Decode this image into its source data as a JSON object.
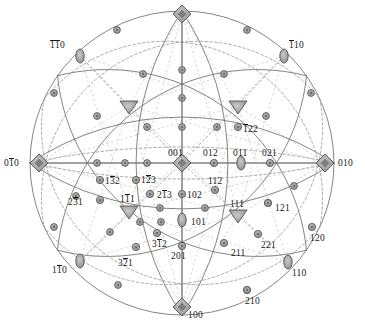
{
  "figure": {
    "type": "stereographic-projection",
    "title": "",
    "circle": {
      "cx": 182,
      "cy": 163,
      "r": 152
    },
    "colors": {
      "background": "#ffffff",
      "line": "#6b6b6b",
      "dashed_line": "#8a8a8a",
      "pole_fill": "#9a9a9a",
      "pole_stroke": "#4a4a4a",
      "text": "#171717"
    },
    "symbols": {
      "four-fold": "filled diamond (square rotated 45°)",
      "three-fold": "filled triangle",
      "two-fold": "small lens / ellipse",
      "general": "small circle"
    }
  },
  "poles": [
    {
      "id": "001",
      "label": "001",
      "bars": [],
      "x": 182,
      "y": 163,
      "sym": "four-fold",
      "lx": 168,
      "ly": 148,
      "anchor": "left"
    },
    {
      "id": "100",
      "label": "100",
      "bars": [],
      "x": 182,
      "y": 307,
      "sym": "four-fold",
      "lx": 188,
      "ly": 310,
      "anchor": "left"
    },
    {
      "id": "010",
      "label": "010",
      "bars": [],
      "x": 325,
      "y": 163,
      "sym": "four-fold",
      "lx": 338,
      "ly": 158,
      "anchor": "left"
    },
    {
      "id": "0-10",
      "label": "010",
      "bars": [
        1
      ],
      "x": 39,
      "y": 163,
      "sym": "four-fold",
      "lx": 4,
      "ly": 158,
      "anchor": "left"
    },
    {
      "id": "001t",
      "label": "001",
      "bars": [],
      "x": 182,
      "y": 14,
      "sym": "four-fold",
      "lx": 0,
      "ly": 0,
      "anchor": "none"
    },
    {
      "id": "-1-10",
      "label": "110",
      "bars": [
        0,
        1
      ],
      "x": 80,
      "y": 56,
      "sym": "two-fold",
      "lx": 50,
      "ly": 40,
      "anchor": "left"
    },
    {
      "id": "-110",
      "label": "110",
      "bars": [
        0
      ],
      "x": 284,
      "y": 56,
      "sym": "two-fold",
      "lx": 289,
      "ly": 40,
      "anchor": "left"
    },
    {
      "id": "1-10",
      "label": "110",
      "bars": [
        1
      ],
      "x": 80,
      "y": 261,
      "sym": "two-fold",
      "lx": 52,
      "ly": 265,
      "anchor": "left"
    },
    {
      "id": "110",
      "label": "110",
      "bars": [],
      "x": 288,
      "y": 262,
      "sym": "two-fold",
      "lx": 292,
      "ly": 268,
      "anchor": "left"
    },
    {
      "id": "011",
      "label": "011",
      "bars": [],
      "x": 241,
      "y": 163,
      "sym": "two-fold",
      "lx": 233,
      "ly": 148,
      "anchor": "left"
    },
    {
      "id": "101",
      "label": "101",
      "bars": [],
      "x": 182,
      "y": 220,
      "sym": "two-fold",
      "lx": 191,
      "ly": 217,
      "anchor": "left"
    },
    {
      "id": "012",
      "label": "012",
      "bars": [],
      "x": 214,
      "y": 163,
      "sym": "general",
      "lx": 203,
      "ly": 148,
      "anchor": "left"
    },
    {
      "id": "021",
      "label": "021",
      "bars": [],
      "x": 270,
      "y": 163,
      "sym": "general",
      "lx": 262,
      "ly": 148,
      "anchor": "left"
    },
    {
      "id": "102",
      "label": "102",
      "bars": [],
      "x": 182,
      "y": 194,
      "sym": "general",
      "lx": 187,
      "ly": 190,
      "anchor": "left"
    },
    {
      "id": "201",
      "label": "201",
      "bars": [],
      "x": 182,
      "y": 246,
      "sym": "general",
      "lx": 171,
      "ly": 251,
      "anchor": "left"
    },
    {
      "id": "111",
      "label": "111",
      "bars": [],
      "x": 238,
      "y": 215,
      "sym": "three-fold",
      "lx": 230,
      "ly": 199,
      "anchor": "left"
    },
    {
      "id": "1-11",
      "label": "111",
      "bars": [
        1
      ],
      "x": 129,
      "y": 211,
      "sym": "three-fold",
      "lx": 120,
      "ly": 194,
      "anchor": "left"
    },
    {
      "id": "-111",
      "label": "111",
      "bars": [
        0
      ],
      "x": 238,
      "y": 106,
      "sym": "three-fold",
      "lx": 0,
      "ly": 0,
      "anchor": "none"
    },
    {
      "id": "-1-11",
      "label": "111",
      "bars": [
        0,
        1
      ],
      "x": 129,
      "y": 106,
      "sym": "three-fold",
      "lx": 0,
      "ly": 0,
      "anchor": "none"
    },
    {
      "id": "112",
      "label": "112",
      "bars": [],
      "x": 215,
      "y": 190,
      "sym": "general",
      "lx": 208,
      "ly": 176,
      "anchor": "left"
    },
    {
      "id": "121",
      "label": "121",
      "bars": [],
      "x": 268,
      "y": 203,
      "sym": "general",
      "lx": 275,
      "ly": 203,
      "anchor": "left"
    },
    {
      "id": "211",
      "label": "211",
      "bars": [],
      "x": 224,
      "y": 243,
      "sym": "general",
      "lx": 231,
      "ly": 248,
      "anchor": "left"
    },
    {
      "id": "221",
      "label": "221",
      "bars": [],
      "x": 258,
      "y": 234,
      "sym": "general",
      "lx": 261,
      "ly": 240,
      "anchor": "left"
    },
    {
      "id": "120",
      "label": "120",
      "bars": [],
      "x": 312,
      "y": 227,
      "sym": "general",
      "lx": 310,
      "ly": 233,
      "anchor": "left"
    },
    {
      "id": "210",
      "label": "210",
      "bars": [],
      "x": 247,
      "y": 290,
      "sym": "general",
      "lx": 245,
      "ly": 296,
      "anchor": "left"
    },
    {
      "id": "-122",
      "label": "122",
      "bars": [
        0
      ],
      "x": 238,
      "y": 127,
      "sym": "general",
      "lx": 243,
      "ly": 124,
      "anchor": "left"
    },
    {
      "id": "1-32",
      "label": "132",
      "bars": [
        1
      ],
      "x": 100,
      "y": 180,
      "sym": "general",
      "lx": 105,
      "ly": 176,
      "anchor": "left"
    },
    {
      "id": "1-23",
      "label": "123",
      "bars": [
        1
      ],
      "x": 136,
      "y": 180,
      "sym": "general",
      "lx": 141,
      "ly": 175,
      "anchor": "left"
    },
    {
      "id": "2-13",
      "label": "213",
      "bars": [
        1
      ],
      "x": 150,
      "y": 194,
      "sym": "general",
      "lx": 157,
      "ly": 190,
      "anchor": "left"
    },
    {
      "id": "2-31",
      "label": "231",
      "bars": [
        1
      ],
      "x": 100,
      "y": 200,
      "sym": "general",
      "lx": 68,
      "ly": 197,
      "anchor": "left"
    },
    {
      "id": "3-12",
      "label": "312",
      "bars": [
        1
      ],
      "x": 157,
      "y": 233,
      "sym": "general",
      "lx": 152,
      "ly": 239,
      "anchor": "left"
    },
    {
      "id": "3-21",
      "label": "321",
      "bars": [
        1
      ],
      "x": 136,
      "y": 247,
      "sym": "general",
      "lx": 118,
      "ly": 258,
      "anchor": "left"
    }
  ],
  "unlabeled_poles": [
    {
      "x": 117,
      "y": 30
    },
    {
      "x": 247,
      "y": 30
    },
    {
      "x": 54,
      "y": 93
    },
    {
      "x": 311,
      "y": 93
    },
    {
      "x": 97,
      "y": 116
    },
    {
      "x": 266,
      "y": 116
    },
    {
      "x": 143,
      "y": 74
    },
    {
      "x": 224,
      "y": 74
    },
    {
      "x": 182,
      "y": 70
    },
    {
      "x": 182,
      "y": 98
    },
    {
      "x": 182,
      "y": 127
    },
    {
      "x": 147,
      "y": 127
    },
    {
      "x": 217,
      "y": 127
    },
    {
      "x": 125,
      "y": 163
    },
    {
      "x": 147,
      "y": 163
    },
    {
      "x": 97,
      "y": 163
    },
    {
      "x": 160,
      "y": 208
    },
    {
      "x": 205,
      "y": 208
    },
    {
      "x": 161,
      "y": 222
    },
    {
      "x": 54,
      "y": 227
    },
    {
      "x": 110,
      "y": 232
    },
    {
      "x": 140,
      "y": 222
    },
    {
      "x": 118,
      "y": 285
    },
    {
      "x": 247,
      "y": 290
    },
    {
      "x": 294,
      "y": 186
    },
    {
      "x": 268,
      "y": 203
    },
    {
      "x": 76,
      "y": 196
    }
  ],
  "great_circles": [
    {
      "name": "primitive-circle",
      "dash": false
    },
    {
      "name": "horizontal-equator",
      "dash": false
    },
    {
      "name": "vertical-meridian",
      "dash": false
    },
    {
      "name": "zone-110-upper",
      "dash": false
    },
    {
      "name": "zone-110-lower",
      "dash": false
    },
    {
      "name": "zone-diagonal-a",
      "dash": false
    },
    {
      "name": "zone-diagonal-b",
      "dash": false
    },
    {
      "name": "zone-dashed-a",
      "dash": true
    },
    {
      "name": "zone-dashed-b",
      "dash": true
    },
    {
      "name": "zone-dashed-c",
      "dash": true
    },
    {
      "name": "zone-dashed-d",
      "dash": true
    }
  ]
}
